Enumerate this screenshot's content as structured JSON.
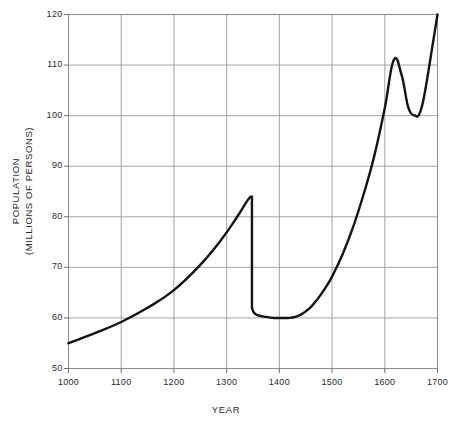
{
  "chart_data": {
    "type": "line",
    "title": "",
    "xlabel": "YEAR",
    "ylabel": "POPULATION (MILLIONS OF PERSONS)",
    "ylabel_line1": "POPULATION",
    "ylabel_line2": "(MILLIONS OF PERSONS)",
    "xlim": [
      1000,
      1700
    ],
    "ylim": [
      50,
      120
    ],
    "xticks": [
      "1000",
      "1100",
      "1200",
      "1300",
      "1400",
      "1500",
      "1600",
      "1700"
    ],
    "yticks": [
      "120",
      "110",
      "100",
      "90",
      "80",
      "70",
      "60",
      "50"
    ],
    "xtick_values": [
      1000,
      1100,
      1200,
      1300,
      1400,
      1500,
      1600,
      1700
    ],
    "ytick_values": [
      120,
      110,
      100,
      90,
      80,
      70,
      60,
      50
    ],
    "grid": true,
    "legend": "none",
    "series": [
      {
        "name": "Population of Europe",
        "color": "#141414",
        "x": [
          1000,
          1050,
          1100,
          1150,
          1200,
          1250,
          1290,
          1320,
          1340,
          1348,
          1348,
          1352,
          1360,
          1375,
          1390,
          1400,
          1410,
          1420,
          1430,
          1440,
          1450,
          1460,
          1470,
          1480,
          1490,
          1500,
          1520,
          1540,
          1560,
          1580,
          1600,
          1617,
          1632,
          1645,
          1658,
          1665,
          1672,
          1680,
          1690,
          1700
        ],
        "values": [
          55,
          57,
          59.2,
          62,
          65.5,
          70.5,
          75.5,
          80,
          83.3,
          84,
          62,
          61,
          60.5,
          60.2,
          60,
          60,
          60,
          60,
          60.2,
          60.6,
          61.3,
          62.2,
          63.4,
          64.8,
          66.4,
          68.2,
          72.6,
          78,
          84.5,
          92,
          101.5,
          111,
          108,
          101.5,
          100,
          100.2,
          102.5,
          107,
          113.5,
          120
        ]
      }
    ],
    "annotations": []
  }
}
